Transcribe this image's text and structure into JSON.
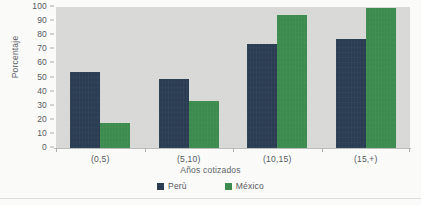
{
  "chart_data": {
    "type": "bar",
    "title": "",
    "xlabel": "Años cotizados",
    "ylabel": "Porcentaje",
    "categories": [
      "(0,5)",
      "(5,10)",
      "(10,15)",
      "(15,+)"
    ],
    "series": [
      {
        "name": "Perù",
        "values": [
          54,
          49,
          74,
          77
        ],
        "color": "#2b3d53"
      },
      {
        "name": "México",
        "values": [
          18,
          33,
          94,
          99
        ],
        "color": "#3d8c4f"
      }
    ],
    "ylim": [
      0,
      100
    ],
    "yticks": [
      0,
      10,
      20,
      30,
      40,
      50,
      60,
      70,
      80,
      90,
      100
    ],
    "ytick_labels": [
      "0",
      "10",
      "20",
      "30",
      "40",
      "50",
      "60",
      "70",
      "80",
      "90",
      "100"
    ],
    "grid": false,
    "legend_position": "bottom-center",
    "plot_background": "#d9d9d7",
    "page_background": "#fbfbfa"
  },
  "legend": {
    "items": [
      {
        "label": "Perù"
      },
      {
        "label": "México"
      }
    ]
  }
}
